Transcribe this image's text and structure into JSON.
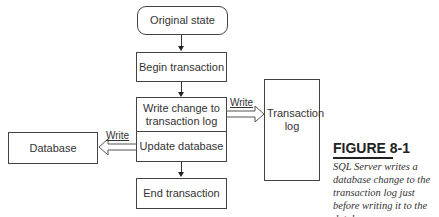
{
  "diagram": {
    "nodes": {
      "original_state": "Original state",
      "begin_transaction": "Begin transaction",
      "write_change_to_log": "Write change to transaction log",
      "update_database": "Update database",
      "end_transaction": "End transaction",
      "transaction_log": "Transaction log",
      "database": "Database"
    },
    "edges": {
      "write_to_log_label": "Write",
      "write_to_db_label": "Write"
    }
  },
  "figure": {
    "title": "FIGURE 8-1",
    "caption": "SQL Server writes a database change to the transaction log just before writing it to the database."
  }
}
